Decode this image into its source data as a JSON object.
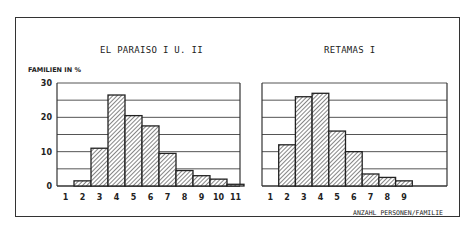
{
  "figure": {
    "left_title": "EL PARAISO I U. II",
    "right_title": "RETAMAS I",
    "y_axis_label": "FAMILIEN IN %",
    "x_axis_label": "ANZAHL PERSONEN/FAMILIE"
  },
  "chart_data": [
    {
      "type": "bar",
      "title": "EL PARAISO I U. II",
      "xlabel": "ANZAHL PERSONEN/FAMILIE",
      "ylabel": "FAMILIEN IN %",
      "categories": [
        "1",
        "2",
        "3",
        "4",
        "5",
        "6",
        "7",
        "8",
        "9",
        "10",
        "11"
      ],
      "values": [
        0,
        1.5,
        11,
        26.5,
        20.5,
        17.5,
        9.5,
        4.5,
        3,
        2,
        0.5
      ],
      "yticks": [
        0,
        10,
        20,
        30
      ],
      "ylim": [
        0,
        30
      ],
      "grid": true,
      "grid_step": 5,
      "bar_fill": "diagonal-hatch"
    },
    {
      "type": "bar",
      "title": "RETAMAS I",
      "xlabel": "ANZAHL PERSONEN/FAMILIE",
      "ylabel": "FAMILIEN IN %",
      "categories": [
        "1",
        "2",
        "3",
        "4",
        "5",
        "6",
        "7",
        "8",
        "9"
      ],
      "values": [
        0,
        12,
        26,
        27,
        16,
        10,
        3.5,
        2.5,
        1.5
      ],
      "yticks": [
        0,
        10,
        20,
        30
      ],
      "ylim": [
        0,
        30
      ],
      "grid": true,
      "grid_step": 5,
      "bar_fill": "diagonal-hatch"
    }
  ],
  "colors": {
    "line": "#333333",
    "grid": "#555555",
    "hatch": "#444444",
    "background": "#ffffff"
  }
}
